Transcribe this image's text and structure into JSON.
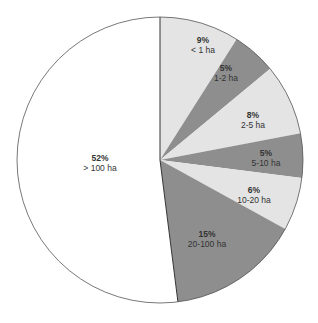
{
  "chart_data": {
    "type": "pie",
    "title": "",
    "start_angle": "12 o'clock",
    "direction": "clockwise",
    "categories": [
      "< 1 ha",
      "1-2 ha",
      "2-5 ha",
      "5-10 ha",
      "10-20 ha",
      "20-100 ha",
      "> 100 ha"
    ],
    "values": [
      9,
      5,
      8,
      5,
      6,
      15,
      52
    ],
    "labels": [
      "9%",
      "5%",
      "8%",
      "5%",
      "6%",
      "15%",
      "52%"
    ],
    "colors": [
      "#e4e4e4",
      "#8e8e8e",
      "#e4e4e4",
      "#8e8e8e",
      "#e4e4e4",
      "#8e8e8e",
      "#ffffff"
    ],
    "label_positions": [
      [
        203,
        45
      ],
      [
        226,
        73
      ],
      [
        253,
        120
      ],
      [
        266,
        158
      ],
      [
        254,
        195
      ],
      [
        207,
        239
      ],
      [
        100,
        163
      ]
    ],
    "legend": "none",
    "center": [
      160,
      160
    ],
    "radius": 143
  }
}
